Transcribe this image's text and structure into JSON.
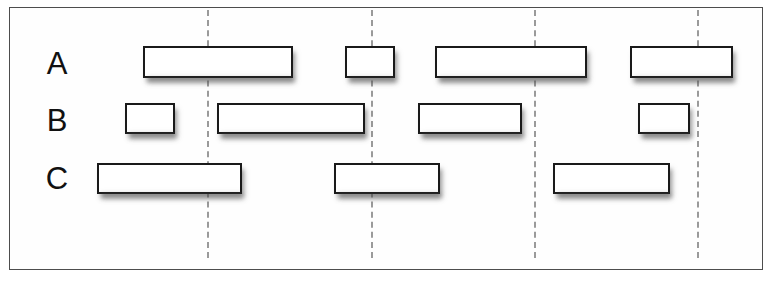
{
  "figure": {
    "width": 770,
    "height": 297,
    "background_color": "#ffffff",
    "frame": {
      "x": 9,
      "y": 7,
      "width": 754,
      "height": 263,
      "border_color": "#4d4d4d"
    },
    "bar_style": {
      "fill_color": "#ffffff",
      "border_color": "#1a1a1a",
      "shadow_color": "#5a5a5a"
    },
    "guideline_style": {
      "color": "#9a9a9a",
      "dash": "dashed"
    }
  },
  "chart_data": {
    "type": "bar",
    "title": "",
    "xlabel": "",
    "ylabel": "",
    "orientation": "horizontal",
    "grid": false,
    "legend": "none",
    "categories": [
      "A",
      "B",
      "C"
    ],
    "guidelines": [
      207,
      371,
      534,
      697
    ],
    "rows": [
      {
        "label": "A",
        "label_x": 57,
        "label_y": 48,
        "bar_top": 46,
        "bar_height": 32,
        "intervals": [
          {
            "start": 143,
            "end": 293,
            "length": 150
          },
          {
            "start": 345,
            "end": 395,
            "length": 50
          },
          {
            "start": 435,
            "end": 587,
            "length": 152
          },
          {
            "start": 630,
            "end": 733,
            "length": 103
          }
        ]
      },
      {
        "label": "B",
        "label_x": 57,
        "label_y": 105,
        "bar_top": 103,
        "bar_height": 31,
        "intervals": [
          {
            "start": 125,
            "end": 175,
            "length": 50
          },
          {
            "start": 217,
            "end": 365,
            "length": 148
          },
          {
            "start": 418,
            "end": 522,
            "length": 104
          },
          {
            "start": 638,
            "end": 690,
            "length": 52
          }
        ]
      },
      {
        "label": "C",
        "label_x": 57,
        "label_y": 163,
        "bar_top": 163,
        "bar_height": 31,
        "intervals": [
          {
            "start": 97,
            "end": 242,
            "length": 145
          },
          {
            "start": 334,
            "end": 440,
            "length": 106
          },
          {
            "start": 553,
            "end": 670,
            "length": 117
          }
        ]
      }
    ]
  }
}
